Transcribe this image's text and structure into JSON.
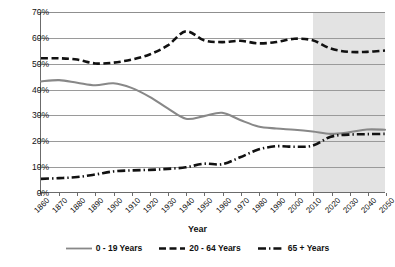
{
  "chart_data": {
    "type": "line",
    "title": "",
    "xlabel": "Year",
    "ylabel": "",
    "xlim": [
      1860,
      2050
    ],
    "ylim": [
      0,
      70
    ],
    "ytick_labels": [
      "0%",
      "10%",
      "20%",
      "30%",
      "40%",
      "50%",
      "60%",
      "70%"
    ],
    "ytick_values": [
      0,
      10,
      20,
      30,
      40,
      50,
      60,
      70
    ],
    "xtick_labels": [
      "1860",
      "1870",
      "1880",
      "1890",
      "1900",
      "1910",
      "1920",
      "1930",
      "1940",
      "1950",
      "1960",
      "1970",
      "1980",
      "1990",
      "2000",
      "2010",
      "2020",
      "2030",
      "2040",
      "2050"
    ],
    "x": [
      1860,
      1870,
      1880,
      1890,
      1900,
      1910,
      1920,
      1930,
      1940,
      1950,
      1960,
      1970,
      1980,
      1990,
      2000,
      2010,
      2020,
      2030,
      2040,
      2050
    ],
    "grid": true,
    "legend_position": "bottom",
    "projection_start": 2010,
    "projection_shading": "#dedede",
    "series": [
      {
        "name": "0 - 19 Years",
        "style": "solid",
        "color": "#888888",
        "values": [
          43.0,
          43.5,
          42.5,
          41.5,
          42.3,
          40.5,
          37.0,
          32.5,
          28.5,
          29.5,
          30.8,
          28.0,
          25.5,
          24.7,
          24.2,
          23.5,
          22.6,
          23.2,
          24.3,
          24.2
        ]
      },
      {
        "name": "20 - 64 Years",
        "style": "dashed",
        "color": "#111111",
        "values": [
          52.0,
          52.0,
          51.5,
          50.0,
          50.3,
          51.5,
          53.5,
          57.0,
          62.5,
          59.0,
          58.3,
          58.8,
          57.8,
          58.3,
          59.6,
          59.0,
          55.8,
          54.5,
          54.5,
          55.0
        ]
      },
      {
        "name": "65 + Years",
        "style": "dash-dot",
        "color": "#111111",
        "values": [
          5.1,
          5.4,
          5.8,
          6.8,
          8.0,
          8.4,
          8.6,
          9.0,
          9.6,
          11.0,
          10.8,
          13.5,
          16.5,
          17.8,
          17.6,
          18.0,
          21.5,
          22.3,
          22.5,
          22.6
        ]
      }
    ],
    "projection_extra": {
      "note": "0-19 and 65+ converge near 22-24% after 2010",
      "series_65_projected": [
        21.5,
        22.3,
        22.5,
        22.6
      ]
    }
  },
  "legend": {
    "items": [
      {
        "label": "0 - 19 Years",
        "swatch": "solid-gray-line"
      },
      {
        "label": "20 - 64 Years",
        "swatch": "dashed-black-line"
      },
      {
        "label": "65 + Years",
        "swatch": "dash-dot-black-line"
      }
    ]
  }
}
